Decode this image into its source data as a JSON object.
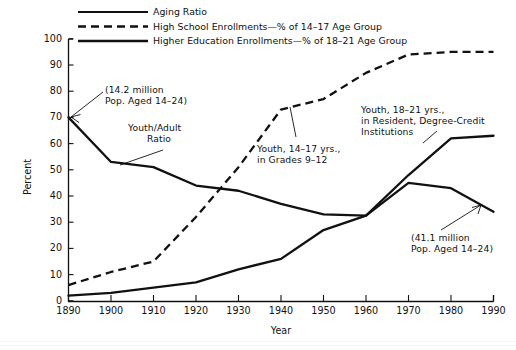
{
  "chart_data": {
    "type": "line",
    "title": "",
    "xlabel": "Year",
    "ylabel": "Percent",
    "xlim": [
      1890,
      1990
    ],
    "ylim": [
      0,
      100
    ],
    "grid": false,
    "legend_position": "top",
    "x": [
      1890,
      1900,
      1910,
      1920,
      1930,
      1940,
      1950,
      1960,
      1970,
      1980,
      1990
    ],
    "xticks": [
      "1890",
      "1900",
      "1910",
      "1920",
      "1930",
      "1940",
      "1950",
      "1960",
      "1970",
      "1980",
      "1990"
    ],
    "yticks": [
      "0",
      "10",
      "20",
      "30",
      "40",
      "50",
      "60",
      "70",
      "80",
      "90",
      "100"
    ],
    "series": [
      {
        "name": "Aging Ratio",
        "style": "solid",
        "values": [
          70,
          53,
          51,
          44,
          42,
          37,
          33,
          32.5,
          45,
          43,
          34
        ]
      },
      {
        "name": "High School Enrollments—% of 14–17 Age Group",
        "style": "dashed",
        "values": [
          6,
          11,
          15,
          32,
          51,
          73,
          77,
          87,
          94,
          95,
          95
        ]
      },
      {
        "name": "Higher Education Enrollments—% of 18–21 Age Group",
        "style": "solid",
        "values": [
          2,
          3,
          5,
          7,
          12,
          16,
          27,
          32.5,
          48,
          62,
          63
        ]
      }
    ],
    "annotations": [
      {
        "id": "pop-1890",
        "lines": [
          "(14.2 million",
          "Pop. Aged 14–24)"
        ],
        "points_to": "Aging Ratio at 1890"
      },
      {
        "id": "youth-adult-ratio",
        "lines": [
          "Youth/Adult",
          "Ratio"
        ],
        "points_to": "Aging Ratio near 1900"
      },
      {
        "id": "youth-14-17",
        "lines": [
          "Youth, 14–17 yrs.,",
          "in Grades 9–12"
        ],
        "points_to": "High School Enrollments near 1930"
      },
      {
        "id": "youth-18-21",
        "lines": [
          "Youth, 18–21 yrs.,",
          "in Resident, Degree-Credit",
          "Institutions"
        ],
        "points_to": "Higher Education Enrollments near 1975"
      },
      {
        "id": "pop-1990",
        "lines": [
          "(41.1 million",
          "Pop. Aged 14–24)"
        ],
        "points_to": "Aging Ratio at 1990"
      }
    ]
  },
  "legend": {
    "items": [
      {
        "label": "Aging Ratio",
        "style": "solid"
      },
      {
        "label": "High School Enrollments—% of 14–17 Age Group",
        "style": "dashed"
      },
      {
        "label": "Higher Education Enrollments—% of 18–21 Age Group",
        "style": "solid"
      }
    ]
  },
  "axes": {
    "y_title": "Percent",
    "x_title": "Year",
    "y_ticks": [
      "100",
      "90",
      "80",
      "70",
      "60",
      "50",
      "40",
      "30",
      "20",
      "10",
      "0"
    ],
    "x_ticks": [
      "1890",
      "1900",
      "1910",
      "1920",
      "1930",
      "1940",
      "1950",
      "1960",
      "1970",
      "1980",
      "1990"
    ]
  },
  "colors": {
    "ink": "#111111",
    "background": "#ffffff"
  }
}
